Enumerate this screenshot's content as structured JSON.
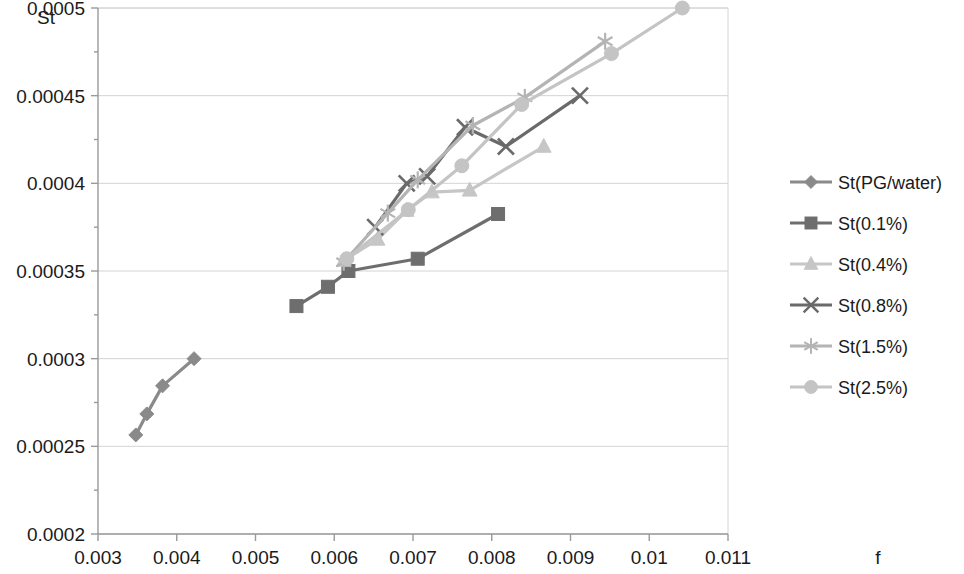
{
  "chart_data": {
    "type": "line",
    "title": "",
    "xlabel": "f",
    "ylabel": "St",
    "xlim": [
      0.003,
      0.011
    ],
    "ylim": [
      0.0002,
      0.0005
    ],
    "xticks": [
      "0.003",
      "0.004",
      "0.005",
      "0.006",
      "0.007",
      "0.008",
      "0.009",
      "0.01",
      "0.011"
    ],
    "xtick_values": [
      0.003,
      0.004,
      0.005,
      0.006,
      0.007,
      0.008,
      0.009,
      0.01,
      0.011
    ],
    "yticks": [
      "0.0002",
      "0.00025",
      "0.0003",
      "0.00035",
      "0.0004",
      "0.00045",
      "0.0005"
    ],
    "ytick_values": [
      0.0002,
      0.00025,
      0.0003,
      0.00035,
      0.0004,
      0.00045,
      0.0005
    ],
    "grid": true,
    "legend_position": "right",
    "series": [
      {
        "name": "St(PG/water)",
        "marker": "diamond",
        "color": "#8a8a8a",
        "x": [
          0.00348,
          0.00362,
          0.00382,
          0.00422
        ],
        "y": [
          0.0002565,
          0.0002685,
          0.0002845,
          0.0003
        ]
      },
      {
        "name": "St(0.1%)",
        "marker": "square",
        "color": "#6e6e6e",
        "x": [
          0.00552,
          0.00592,
          0.00618,
          0.00706,
          0.00808
        ],
        "y": [
          0.00033,
          0.000341,
          0.00035,
          0.000357,
          0.0003825
        ]
      },
      {
        "name": "St(0.4%)",
        "marker": "triangle",
        "color": "#c6c6c6",
        "x": [
          0.00612,
          0.00655,
          0.00692,
          0.00724,
          0.00772,
          0.00866
        ],
        "y": [
          0.000356,
          0.000368,
          0.0003845,
          0.000395,
          0.000396,
          0.000421
        ]
      },
      {
        "name": "St(0.8%)",
        "marker": "x",
        "color": "#6a6a6a",
        "x": [
          0.00652,
          0.00692,
          0.00718,
          0.00766,
          0.00818,
          0.00912
        ],
        "y": [
          0.000375,
          0.0004,
          0.000404,
          0.000432,
          0.000421,
          0.00045
        ]
      },
      {
        "name": "St(1.5%)",
        "marker": "star",
        "color": "#b4b4b4",
        "x": [
          0.00612,
          0.00668,
          0.00706,
          0.00776,
          0.00842,
          0.00944
        ],
        "y": [
          0.000355,
          0.000383,
          0.000402,
          0.000433,
          0.000449,
          0.000481
        ]
      },
      {
        "name": "St(2.5%)",
        "marker": "circle",
        "color": "#c4c4c4",
        "x": [
          0.00616,
          0.00694,
          0.00762,
          0.00838,
          0.00952,
          0.01042
        ],
        "y": [
          0.000357,
          0.000385,
          0.00041,
          0.000445,
          0.000474,
          0.0005
        ]
      }
    ]
  }
}
